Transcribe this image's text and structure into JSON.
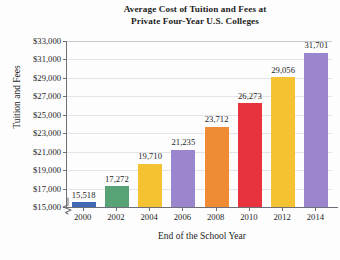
{
  "chart_data": {
    "type": "bar",
    "title": "Average Cost of Tuition and Fees at Private Four-Year U.S. Colleges",
    "title_line1": "Average Cost of Tuition and Fees at",
    "title_line2": "Private Four-Year U.S. Colleges",
    "xlabel": "End of the School Year",
    "ylabel": "Tuition and Fees",
    "categories": [
      "2000",
      "2002",
      "2004",
      "2006",
      "2008",
      "2010",
      "2012",
      "2014"
    ],
    "values": [
      15518,
      17272,
      19710,
      21235,
      23712,
      26273,
      29056,
      31701
    ],
    "value_labels": [
      "15,518",
      "17,272",
      "19,710",
      "21,235",
      "23,712",
      "26,273",
      "29,056",
      "31,701"
    ],
    "bar_colors": [
      "#4169b6",
      "#57a376",
      "#f5c231",
      "#9b85cc",
      "#ef8b34",
      "#e8333f",
      "#f5c231",
      "#9b85cc"
    ],
    "ylim": [
      15000,
      33000
    ],
    "y_ticks": [
      15000,
      17000,
      19000,
      21000,
      23000,
      25000,
      27000,
      29000,
      31000,
      33000
    ],
    "y_tick_labels": [
      "$15,000",
      "$17,000",
      "$19,000",
      "$21,000",
      "$23,000",
      "$25,000",
      "$27,000",
      "$29,000",
      "$31,000",
      "$33,000"
    ],
    "grid": true,
    "legend": "none",
    "axis_break": true,
    "axis_break_note": "y-axis broken below $15,000",
    "background_color": "#ffffff",
    "gridline_color": "#e3e3ea",
    "axis_color": "#6e6e78"
  }
}
